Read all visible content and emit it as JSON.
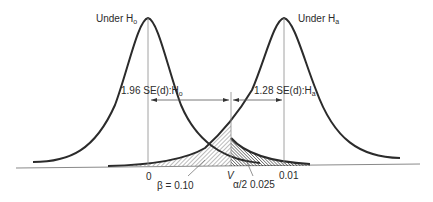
{
  "diagram": {
    "curves": [
      {
        "id": "h0",
        "label": "Under H",
        "label_sub": "o",
        "mean_label": "0"
      },
      {
        "id": "ha",
        "label": "Under H",
        "label_sub": "a",
        "mean_label": "0.01"
      }
    ],
    "critical_value_label": "V",
    "spans": {
      "h0": {
        "text": "1.96 SE(d):H",
        "sub": "o"
      },
      "ha": {
        "text": "1.28 SE(d):H",
        "sub": "a"
      }
    },
    "areas": {
      "beta": "β = 0.10",
      "alpha_half": "α/2  0.025"
    },
    "colors": {
      "ink": "#2b2b2b",
      "thin": "#8a8a8a",
      "background": "#ffffff"
    }
  }
}
